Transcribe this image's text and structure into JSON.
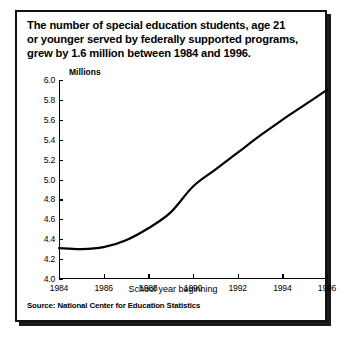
{
  "figure": {
    "title_lines": [
      "The number of special education students, age 21",
      "or younger served by federally supported programs,",
      "grew by 1.6 million between 1984 and 1996."
    ],
    "source": "Source: National Center for Education Statistics"
  },
  "chart_data": {
    "type": "line",
    "title": "The number of special education students, age 21 or younger served by federally supported programs, grew by 1.6 million between 1984 and 1996.",
    "xlabel": "School year beginning",
    "ylabel": "Millions",
    "y_unit_label": "Millions",
    "xlim": [
      1984,
      1996
    ],
    "ylim": [
      4.0,
      6.0
    ],
    "grid": false,
    "legend": false,
    "x_ticks": [
      1984,
      1986,
      1988,
      1990,
      1992,
      1994,
      1996
    ],
    "x_tick_labels": [
      "1984",
      "1986",
      "1988",
      "1990",
      "1992",
      "1994",
      "1996"
    ],
    "y_ticks": [
      4.0,
      4.2,
      4.4,
      4.6,
      4.8,
      5.0,
      5.2,
      5.4,
      5.6,
      5.8,
      6.0
    ],
    "y_tick_labels": [
      "4.0",
      "4.2",
      "4.4",
      "4.6",
      "4.8",
      "5.0",
      "5.2",
      "5.4",
      "5.6",
      "5.8",
      "6.0"
    ],
    "line_color": "#000000",
    "line_width": 2.2,
    "x": [
      1984,
      1985,
      1986,
      1987,
      1988,
      1989,
      1990,
      1991,
      1992,
      1993,
      1994,
      1995,
      1996
    ],
    "values": [
      4.31,
      4.3,
      4.32,
      4.39,
      4.51,
      4.67,
      4.93,
      5.1,
      5.27,
      5.44,
      5.6,
      5.75,
      5.9
    ],
    "series": [
      {
        "name": "Special education students served",
        "values": [
          4.31,
          4.3,
          4.32,
          4.39,
          4.51,
          4.67,
          4.93,
          5.1,
          5.27,
          5.44,
          5.6,
          5.75,
          5.9
        ]
      }
    ]
  }
}
